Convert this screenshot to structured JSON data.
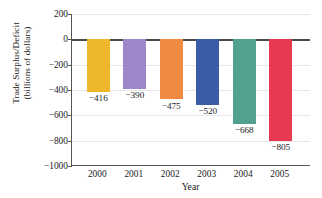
{
  "chart_data": {
    "type": "bar",
    "title": "",
    "xlabel": "Year",
    "ylabel": "Trade Surplus/Deficit (billions of dollars)",
    "ylabel_line1": "Trade Surplus/Deficit",
    "ylabel_line2": "(billions of dollars)",
    "categories": [
      "2000",
      "2001",
      "2002",
      "2003",
      "2004",
      "2005"
    ],
    "values": [
      -416,
      -390,
      -475,
      -520,
      -668,
      -805
    ],
    "value_labels": [
      "−416",
      "−390",
      "−475",
      "−520",
      "−668",
      "−805"
    ],
    "bar_colors": [
      "#EDB62B",
      "#9D87C9",
      "#F08A43",
      "#3A5BA6",
      "#52A08E",
      "#E73A51"
    ],
    "ylim": [
      -1000,
      200
    ],
    "ytick_values": [
      200,
      0,
      -200,
      -400,
      -600,
      -800,
      -1000
    ],
    "ytick_labels": [
      "200",
      "0",
      "−200",
      "−400",
      "−600",
      "−800",
      "−1000"
    ],
    "grid": "horizontal",
    "legend": "none"
  }
}
